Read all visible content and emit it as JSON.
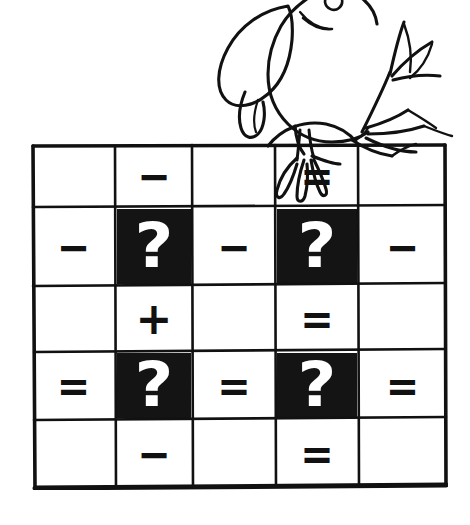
{
  "artwork": {
    "title": "Bird perched on puzzle grid",
    "description": "Hand-drawn black-and-white line art of a bird standing on the top edge of a five by five puzzle grid",
    "line_color": "#111111",
    "background_color": "#ffffff",
    "bird": {
      "name": "perched-bird",
      "parts": [
        "head",
        "beak",
        "eye",
        "wing",
        "body",
        "legs",
        "claws",
        "tail-feathers"
      ]
    }
  },
  "grid": {
    "name": "puzzle-grid",
    "rows": 5,
    "columns": 5,
    "border_color": "#111111",
    "cell_fill_light": "#ffffff",
    "cell_fill_dark": "#141414",
    "question_mark_color": "#ffffff",
    "symbol_legend": {
      "minus": "−",
      "plus": "+",
      "equals": "=",
      "question": "?",
      "empty": ""
    },
    "cells": [
      [
        {
          "symbol": "",
          "type": "empty",
          "dark": false
        },
        {
          "symbol": "−",
          "type": "minus",
          "dark": false
        },
        {
          "symbol": "",
          "type": "empty",
          "dark": false
        },
        {
          "symbol": "=",
          "type": "equals",
          "dark": false
        },
        {
          "symbol": "",
          "type": "empty",
          "dark": false
        }
      ],
      [
        {
          "symbol": "−",
          "type": "minus",
          "dark": false
        },
        {
          "symbol": "?",
          "type": "question",
          "dark": true
        },
        {
          "symbol": "−",
          "type": "minus",
          "dark": false
        },
        {
          "symbol": "?",
          "type": "question",
          "dark": true
        },
        {
          "symbol": "−",
          "type": "minus",
          "dark": false
        }
      ],
      [
        {
          "symbol": "",
          "type": "empty",
          "dark": false
        },
        {
          "symbol": "+",
          "type": "plus",
          "dark": false
        },
        {
          "symbol": "",
          "type": "empty",
          "dark": false
        },
        {
          "symbol": "=",
          "type": "equals",
          "dark": false
        },
        {
          "symbol": "",
          "type": "empty",
          "dark": false
        }
      ],
      [
        {
          "symbol": "=",
          "type": "equals",
          "dark": false
        },
        {
          "symbol": "?",
          "type": "question",
          "dark": true
        },
        {
          "symbol": "=",
          "type": "equals",
          "dark": false
        },
        {
          "symbol": "?",
          "type": "question",
          "dark": true
        },
        {
          "symbol": "=",
          "type": "equals",
          "dark": false
        }
      ],
      [
        {
          "symbol": "",
          "type": "empty",
          "dark": false
        },
        {
          "symbol": "−",
          "type": "minus",
          "dark": false
        },
        {
          "symbol": "",
          "type": "empty",
          "dark": false
        },
        {
          "symbol": "=",
          "type": "equals",
          "dark": false
        },
        {
          "symbol": "",
          "type": "empty",
          "dark": false
        }
      ]
    ],
    "column_edges": [
      0,
      84,
      161,
      244,
      327,
      415
    ],
    "row_edges": [
      0,
      64,
      142,
      208,
      276,
      345
    ]
  }
}
